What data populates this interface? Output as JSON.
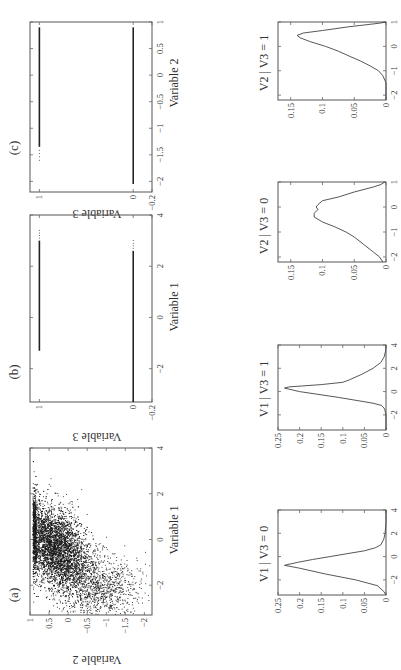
{
  "figure": {
    "orientation": "rotated 90 degrees (landscape figure displayed in portrait)",
    "panel_labels": [
      "(a)",
      "(b)",
      "(c)"
    ]
  },
  "chart_data": [
    {
      "id": "a",
      "type": "scatter",
      "label": "(a)",
      "title": "",
      "xlabel": "Variable 1",
      "ylabel": "Variable 2",
      "xlim": [
        -3.3,
        4
      ],
      "ylim": [
        -2.2,
        1
      ],
      "xticks": [
        "-2",
        "0",
        "2",
        "4"
      ],
      "yticks": [
        "-2",
        "-1.5",
        "-1",
        "-0.5",
        "0",
        "0.5",
        "1"
      ],
      "description": "Dense cloud of ~10000 points; bulk centered near V1≈-0.5, V2≈0.3; upper bound near V2≈0.9 across V1∈[-2.5,1]; lower tail extends to V2≈-2.1 around V1∈[-3,-1]; sparse points reach V1≈3.5",
      "grid": false
    },
    {
      "id": "b",
      "type": "scatter",
      "label": "(b)",
      "xlabel": "Variable 1",
      "ylabel": "Variable 3",
      "xlim": [
        -3.3,
        4
      ],
      "ylim": [
        -0.2,
        1.1
      ],
      "xticks": [
        "-2",
        "0",
        "2",
        "4"
      ],
      "yticks": [
        "-0.2",
        "0",
        "1"
      ],
      "series": [
        {
          "name": "V3 = 0",
          "y": 0,
          "x_range": [
            -3.3,
            2.6
          ],
          "sparse_to": 3.0
        },
        {
          "name": "V3 = 1",
          "y": 1,
          "x_range": [
            -1.3,
            3.0
          ],
          "sparse_to": 3.4
        }
      ],
      "grid": false
    },
    {
      "id": "c",
      "type": "scatter",
      "label": "(c)",
      "xlabel": "Variable 2",
      "ylabel": "Variable 3",
      "xlim": [
        -2.2,
        1
      ],
      "ylim": [
        -0.2,
        1.1
      ],
      "xticks": [
        "-2",
        "-1.5",
        "-1",
        "-0.5",
        "0",
        "0.5",
        "1"
      ],
      "yticks": [
        "-0.2",
        "0",
        "1"
      ],
      "series": [
        {
          "name": "V3 = 0",
          "y": 0,
          "x_range": [
            -2.05,
            0.9
          ]
        },
        {
          "name": "V3 = 1",
          "y": 1,
          "x_range": [
            -1.35,
            0.9
          ],
          "sparse_from": -1.6
        }
      ],
      "grid": false
    },
    {
      "id": "d1",
      "type": "line",
      "title": "V1 | V3 = 0",
      "xlim": [
        -3.3,
        4
      ],
      "ylim": [
        0,
        0.25
      ],
      "xticks": [
        "-2",
        "0",
        "2",
        "4"
      ],
      "yticks": [
        "0",
        "0.05",
        "0.1",
        "0.15",
        "0.2",
        "0.25"
      ],
      "x": [
        -3.3,
        -3.0,
        -2.5,
        -2.0,
        -1.5,
        -1.0,
        -0.75,
        -0.5,
        -0.25,
        0.0,
        0.25,
        0.5,
        0.75,
        1.0,
        1.5,
        2.0,
        2.5,
        3.0,
        3.5,
        4.0
      ],
      "y": [
        0.0,
        0.005,
        0.02,
        0.07,
        0.14,
        0.2,
        0.235,
        0.205,
        0.17,
        0.13,
        0.09,
        0.05,
        0.025,
        0.012,
        0.005,
        0.002,
        0.001,
        0.0,
        0.0,
        0.0
      ]
    },
    {
      "id": "d2",
      "type": "line",
      "title": "V1 | V3 = 1",
      "xlim": [
        -3.3,
        4
      ],
      "ylim": [
        0,
        0.25
      ],
      "xticks": [
        "-2",
        "0",
        "2",
        "4"
      ],
      "yticks": [
        "0",
        "0.05",
        "0.1",
        "0.15",
        "0.2",
        "0.25"
      ],
      "x": [
        -3.3,
        -2.0,
        -1.5,
        -1.2,
        -1.0,
        -0.5,
        0.0,
        0.3,
        0.4,
        0.6,
        0.8,
        1.0,
        1.5,
        2.0,
        2.5,
        3.0,
        3.5,
        4.0
      ],
      "y": [
        0.0,
        0.0,
        0.003,
        0.01,
        0.03,
        0.11,
        0.2,
        0.235,
        0.225,
        0.15,
        0.1,
        0.085,
        0.055,
        0.03,
        0.012,
        0.004,
        0.001,
        0.0
      ]
    },
    {
      "id": "d3",
      "type": "line",
      "title": "V2 | V3 = 0",
      "xlim": [
        -2.2,
        1
      ],
      "ylim": [
        0,
        0.17
      ],
      "xticks": [
        "-2",
        "-1",
        "0",
        "1"
      ],
      "yticks": [
        "0",
        "0.05",
        "0.1",
        "0.15"
      ],
      "x": [
        -2.2,
        -2.0,
        -1.8,
        -1.5,
        -1.2,
        -1.0,
        -0.8,
        -0.6,
        -0.4,
        -0.25,
        -0.1,
        0.0,
        0.1,
        0.25,
        0.4,
        0.6,
        0.8,
        0.9,
        1.0
      ],
      "y": [
        0.005,
        0.01,
        0.02,
        0.035,
        0.05,
        0.063,
        0.08,
        0.1,
        0.113,
        0.113,
        0.107,
        0.11,
        0.107,
        0.1,
        0.075,
        0.05,
        0.02,
        0.008,
        0.002
      ]
    },
    {
      "id": "d4",
      "type": "line",
      "title": "V2 | V3 = 1",
      "xlim": [
        -2.2,
        1
      ],
      "ylim": [
        0,
        0.17
      ],
      "xticks": [
        "-2",
        "-1",
        "0",
        "1"
      ],
      "yticks": [
        "0",
        "0.05",
        "0.1",
        "0.15"
      ],
      "x": [
        -2.2,
        -1.5,
        -1.2,
        -1.0,
        -0.8,
        -0.6,
        -0.4,
        -0.2,
        0.0,
        0.2,
        0.35,
        0.45,
        0.55,
        0.65,
        0.8,
        0.95,
        1.0
      ],
      "y": [
        0.0,
        0.0,
        0.005,
        0.012,
        0.025,
        0.04,
        0.058,
        0.075,
        0.095,
        0.12,
        0.135,
        0.14,
        0.13,
        0.1,
        0.06,
        0.01,
        0.0
      ]
    }
  ]
}
